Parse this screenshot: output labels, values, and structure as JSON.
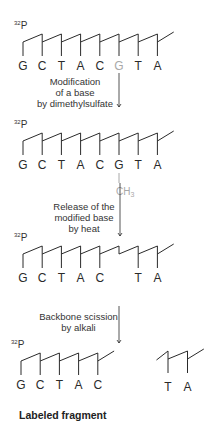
{
  "colors": {
    "ink": "#2a2a2a",
    "faded": "#a8a8a8",
    "background": "#ffffff"
  },
  "label_isotope": "32",
  "label_phosphate": "P",
  "stages": [
    {
      "id": "original",
      "y": 34,
      "bases": [
        "G",
        "C",
        "T",
        "A",
        "C",
        "G",
        "T",
        "A"
      ],
      "faded_indices": [
        5
      ],
      "missing_indices": [],
      "methyl_on": null
    },
    {
      "id": "methylated",
      "y": 133,
      "bases": [
        "G",
        "C",
        "T",
        "A",
        "C",
        "G",
        "T",
        "A"
      ],
      "faded_indices": [],
      "missing_indices": [],
      "methyl_on": 5
    },
    {
      "id": "depurinated",
      "y": 246,
      "bases": [
        "G",
        "C",
        "T",
        "A",
        "C",
        "",
        "T",
        "A"
      ],
      "faded_indices": [],
      "missing_indices": [
        5
      ],
      "methyl_on": null
    }
  ],
  "methyl_label": "CH",
  "methyl_subscript": "3",
  "steps": [
    {
      "lines": [
        "Modification",
        "of a base",
        "by dimethylsulfate"
      ]
    },
    {
      "lines": [
        "Release of the",
        "modified base",
        "by heat"
      ]
    },
    {
      "lines": [
        "Backbone scission",
        "by alkali"
      ]
    }
  ],
  "fragments": {
    "labeled": {
      "bases": [
        "G",
        "C",
        "T",
        "A",
        "C"
      ]
    },
    "unlabeled": {
      "bases": [
        "T",
        "A"
      ]
    },
    "labeled_caption": "Labeled fragment"
  }
}
